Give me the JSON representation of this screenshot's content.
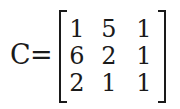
{
  "equation": {
    "lhs": "C",
    "operator": "=",
    "matrix": [
      [
        "1",
        "5",
        "1"
      ],
      [
        "6",
        "2",
        "1"
      ],
      [
        "2",
        "1",
        "1"
      ]
    ]
  }
}
